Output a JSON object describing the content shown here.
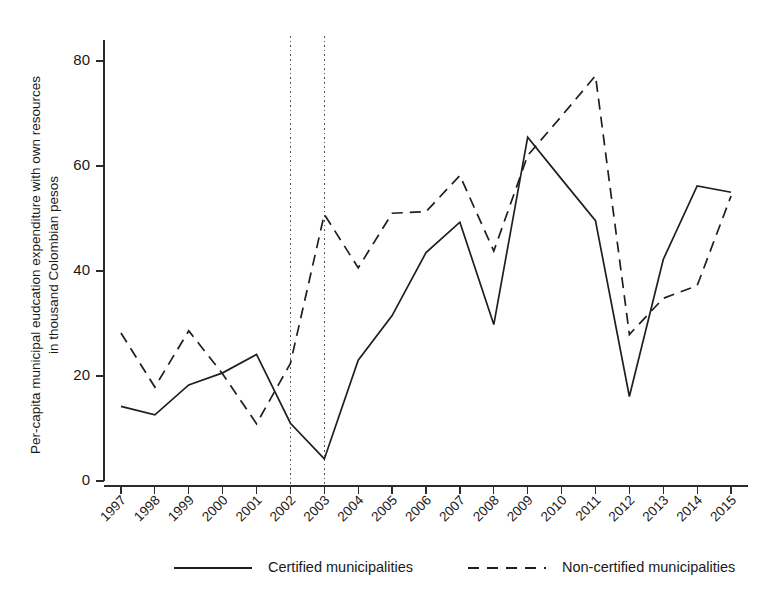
{
  "chart_data": {
    "type": "line",
    "title": "",
    "xlabel": "",
    "ylabel": "Per-capita municipal eudcation expenditure with own resources in thousand Colombian pesos",
    "ylabel_line1": "Per-capita municipal eudcation expenditure with own resources",
    "ylabel_line2": "in thousand Colombian pesos",
    "x": [
      1997,
      1998,
      1999,
      2000,
      2001,
      2002,
      2003,
      2004,
      2005,
      2006,
      2007,
      2008,
      2009,
      2010,
      2011,
      2012,
      2013,
      2014,
      2015
    ],
    "categories": [
      "1997",
      "1998",
      "1999",
      "2000",
      "2001",
      "2002",
      "2003",
      "2004",
      "2005",
      "2006",
      "2007",
      "2008",
      "2009",
      "2010",
      "2011",
      "2012",
      "2013",
      "2014",
      "2015"
    ],
    "series": [
      {
        "name": "Certified municipalities",
        "style": "solid",
        "values": [
          14.2,
          12.6,
          18.3,
          20.6,
          24.1,
          11.0,
          4.2,
          23.0,
          31.5,
          43.5,
          49.3,
          29.8,
          65.5,
          57.5,
          49.6,
          16.1,
          42.2,
          56.2,
          55.0
        ]
      },
      {
        "name": "Non-certified municipalities",
        "style": "dashed",
        "values": [
          28.2,
          17.9,
          28.6,
          20.4,
          10.9,
          22.4,
          50.8,
          40.6,
          51.0,
          51.3,
          58.2,
          43.8,
          62.0,
          69.5,
          77.2,
          27.9,
          34.8,
          37.2,
          54.3
        ]
      }
    ],
    "yticks": [
      0,
      20,
      40,
      60,
      80
    ],
    "ytick_labels": [
      "0",
      "20",
      "40",
      "60",
      "80"
    ],
    "ylim": [
      0,
      84
    ],
    "xlim": [
      1996.5,
      2015.5
    ],
    "grid": false,
    "legend_position": "bottom",
    "reference_lines": [
      {
        "name": "vline-2002",
        "x": 2002
      },
      {
        "name": "vline-2003",
        "x": 2003
      }
    ]
  },
  "legend": {
    "items": [
      {
        "label": "Certified municipalities",
        "style": "solid"
      },
      {
        "label": "Non-certified municipalities",
        "style": "dashed"
      }
    ]
  }
}
